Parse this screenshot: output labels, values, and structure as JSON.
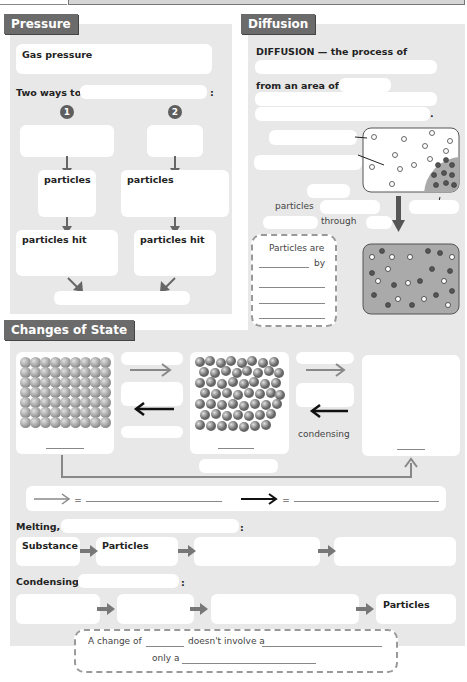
{
  "pressure": {
    "title": "Pressure",
    "gas_pressure_label": "Gas pressure",
    "two_ways_label": "Two ways to",
    "colon": ":",
    "way_numbers": [
      "1",
      "2"
    ],
    "particles_label": "particles",
    "particles_hit_label": "particles hit"
  },
  "diffusion": {
    "title": "Diffusion",
    "definition_label": "DIFFUSION — the process of",
    "from_area_label": "from an area of",
    "period": ".",
    "particles_label": "particles",
    "through_label": "through",
    "note_line1": "Particles are",
    "note_by": "by"
  },
  "changes": {
    "title": "Changes of State",
    "condensing_label": "condensing",
    "legend_equals": "=",
    "melting_label": "Melting,",
    "colon": ":",
    "melting_chain": [
      "Substance",
      "Particles",
      "",
      ""
    ],
    "condensing_label2": "Condensing",
    "condensing_chain": [
      "",
      "",
      "",
      "Particles"
    ],
    "note_part1": "A change of",
    "note_part2": "doesn't involve a",
    "note_part3": "only a"
  },
  "colors": {
    "panel_bg": "#e8e8e8",
    "tab_bg": "#6b6b6b",
    "arrow_gray": "#888888",
    "arrow_dark": "#666666"
  }
}
